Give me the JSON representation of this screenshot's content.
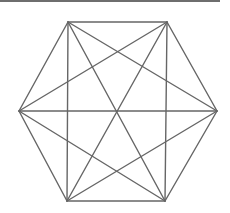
{
  "diagram": {
    "type": "complete-graph",
    "vertex_count": 6,
    "edge_count": 15,
    "colors": {
      "edge": "#666666",
      "top_rule": "#6e6e6e",
      "background": "#ffffff"
    },
    "vertices": [
      {
        "id": "top-left",
        "x": 68,
        "y": 22
      },
      {
        "id": "top-right",
        "x": 167,
        "y": 22
      },
      {
        "id": "right",
        "x": 217,
        "y": 111
      },
      {
        "id": "bottom-right",
        "x": 165,
        "y": 201
      },
      {
        "id": "bottom-left",
        "x": 67,
        "y": 201
      },
      {
        "id": "left",
        "x": 19,
        "y": 111
      }
    ]
  }
}
